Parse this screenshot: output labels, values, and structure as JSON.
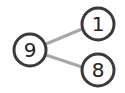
{
  "diagram": {
    "type": "number-bond",
    "whole": {
      "value": "9"
    },
    "parts": [
      {
        "value": "1"
      },
      {
        "value": "8"
      }
    ],
    "colors": {
      "circle_stroke": "#3a3a3a",
      "connector": "#a8a8a8",
      "text": "#222222",
      "background": "#ffffff"
    }
  }
}
